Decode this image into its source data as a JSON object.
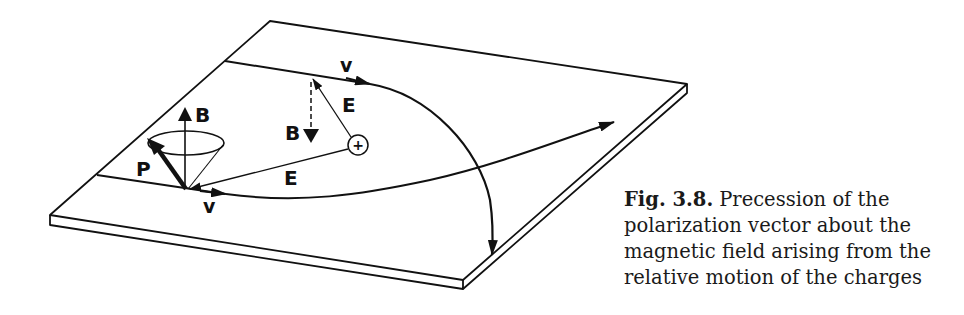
{
  "figure": {
    "labels": {
      "B_up": "B",
      "B_down": "B",
      "P": "P",
      "E_upper": "E",
      "E_lower": "E",
      "v_upper": "v",
      "v_lower": "v",
      "charge": "+"
    },
    "colors": {
      "ink": "#111111",
      "background": "#ffffff"
    }
  },
  "caption": {
    "figure_number": "Fig. 3.8.",
    "lines": [
      "Precession of the",
      "polarization vector about the",
      "magnetic field arising from the",
      "relative motion of the charges"
    ]
  }
}
